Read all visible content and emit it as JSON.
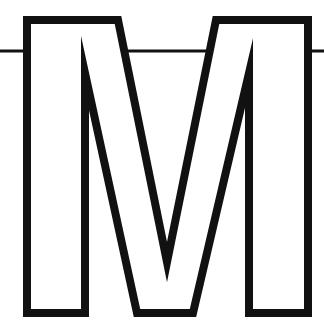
{
  "document": {
    "title": "Letter M outline glyph",
    "kind": "line-art-glyph",
    "width": 324,
    "height": 336,
    "background_color": "#FFFFFF",
    "ink_color": "#111111",
    "alt_text": "Outlined capital letter M with a thin horizontal rule crossing it"
  },
  "glyph": {
    "character": "M",
    "style": "outline",
    "stroke_color": "#111111",
    "fill_color": "#FFFFFF",
    "stroke_width": 8,
    "outline_path": "M 27 20 L 118 20 L 167 262 L 216 20 L 308 20 L 308 313 L 249 313 L 249 73 L 193 313 L 137 313 L 85 73 L 85 313 L 27 313 Z",
    "bounds": {
      "left": 27,
      "top": 20,
      "right": 308,
      "bottom": 313
    }
  },
  "rule": {
    "name": "horizontal-rule",
    "color": "#111111",
    "thickness": 3,
    "y": 51,
    "x_start": 0,
    "x_end": 324
  },
  "labels": {
    "artwork_caption": "M",
    "rule_caption": "horizontal rule"
  }
}
